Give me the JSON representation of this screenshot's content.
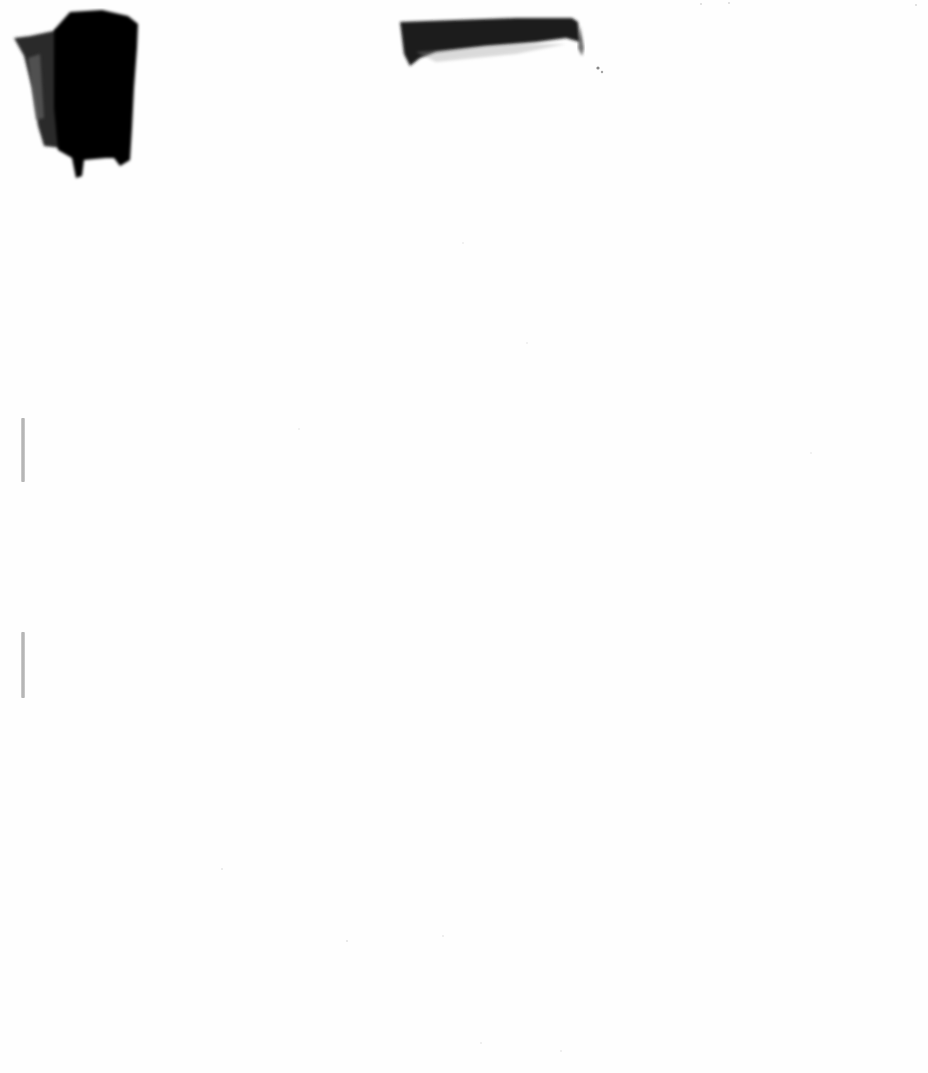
{
  "document": {
    "type": "scanned-page",
    "background_color": "#fefefe",
    "text_content": [],
    "marks": [
      {
        "kind": "redaction-block",
        "color": "#0a0a0a",
        "position": "top-left"
      },
      {
        "kind": "redaction-bar",
        "color": "#1a1a1a",
        "position": "top-center"
      },
      {
        "kind": "binding-mark",
        "color": "#a8a8a8",
        "position": "left-edge-upper"
      },
      {
        "kind": "binding-mark",
        "color": "#a8a8a8",
        "position": "left-edge-lower"
      }
    ]
  }
}
